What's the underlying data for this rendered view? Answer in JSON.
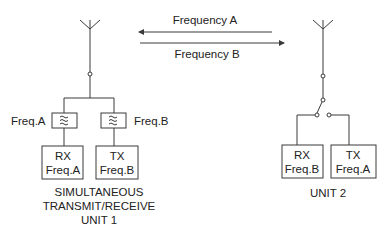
{
  "colors": {
    "line": "#3a3a3a",
    "text": "#222222",
    "background": "#ffffff"
  },
  "arrows": {
    "top": {
      "label": "Frequency A",
      "direction": "left"
    },
    "bottom": {
      "label": "Frequency B",
      "direction": "right"
    }
  },
  "unit1": {
    "filter_left_label": "Freq.A",
    "filter_right_label": "Freq.B",
    "filter_icon": "≈",
    "rx": {
      "line1": "RX",
      "line2": "Freq.A"
    },
    "tx": {
      "line1": "TX",
      "line2": "Freq.B"
    },
    "caption": [
      "SIMULTANEOUS",
      "TRANSMIT/RECEIVE",
      "UNIT 1"
    ]
  },
  "unit2": {
    "rx": {
      "line1": "RX",
      "line2": "Freq.B"
    },
    "tx": {
      "line1": "TX",
      "line2": "Freq.A"
    },
    "caption": "UNIT 2"
  }
}
